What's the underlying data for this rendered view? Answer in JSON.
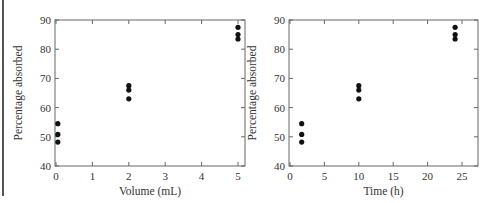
{
  "chart_data": [
    {
      "type": "scatter",
      "title": "",
      "xlabel": "Volume (mL)",
      "ylabel": "Percentage absorbed",
      "xlim": [
        0,
        5.2
      ],
      "ylim": [
        40,
        90
      ],
      "xticks": [
        0,
        1,
        2,
        3,
        4,
        5
      ],
      "yticks": [
        40,
        50,
        60,
        70,
        80,
        90
      ],
      "grid": false,
      "legend": null,
      "series": [
        {
          "name": "Absorption",
          "points": [
            {
              "x": 0.05,
              "y": 54.5
            },
            {
              "x": 0.05,
              "y": 50.8
            },
            {
              "x": 0.05,
              "y": 48.2
            },
            {
              "x": 2,
              "y": 67.5
            },
            {
              "x": 2,
              "y": 66
            },
            {
              "x": 2,
              "y": 63
            },
            {
              "x": 5,
              "y": 87.5
            },
            {
              "x": 5,
              "y": 85
            },
            {
              "x": 5,
              "y": 83.5
            }
          ]
        }
      ]
    },
    {
      "type": "scatter",
      "title": "",
      "xlabel": "Time (h)",
      "ylabel": "Percentage absorbed",
      "xlim": [
        0,
        27
      ],
      "ylim": [
        40,
        90
      ],
      "xticks": [
        0,
        5,
        10,
        15,
        20,
        25
      ],
      "yticks": [
        40,
        50,
        60,
        70,
        80,
        90
      ],
      "grid": false,
      "legend": null,
      "series": [
        {
          "name": "Absorption",
          "points": [
            {
              "x": 1.7,
              "y": 54.5
            },
            {
              "x": 1.7,
              "y": 50.8
            },
            {
              "x": 1.7,
              "y": 48.2
            },
            {
              "x": 10,
              "y": 67.5
            },
            {
              "x": 10,
              "y": 66
            },
            {
              "x": 10,
              "y": 63
            },
            {
              "x": 24,
              "y": 87.5
            },
            {
              "x": 24,
              "y": 85
            },
            {
              "x": 24,
              "y": 83.5
            }
          ]
        }
      ]
    }
  ],
  "layout": [
    {
      "box": [
        55,
        20,
        245,
        166
      ]
    },
    {
      "box": [
        289,
        20,
        478,
        166
      ]
    }
  ],
  "style": {
    "axis_color": "#666666",
    "point_color": "#111111",
    "text_color": "#333333"
  }
}
